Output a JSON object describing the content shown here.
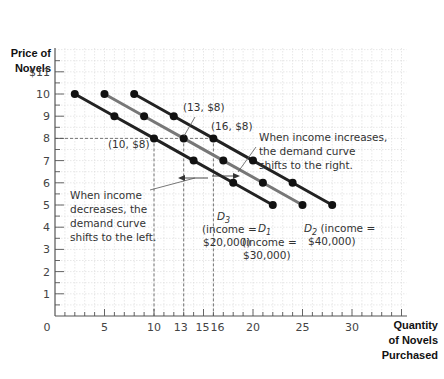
{
  "chart_data": {
    "type": "line",
    "title": "",
    "ylabel": "Price of Novels",
    "xlabel": "Quantity of Novels Purchased",
    "xlim": [
      0,
      35
    ],
    "ylim": [
      0,
      11
    ],
    "grid": true,
    "x_ticks": [
      "0",
      "5",
      "10",
      "13",
      "15",
      "16",
      "20",
      "25",
      "30"
    ],
    "x_tick_values": [
      0,
      5,
      10,
      13,
      15,
      16,
      20,
      25,
      30
    ],
    "y_ticks": [
      "1",
      "2",
      "3",
      "4",
      "5",
      "6",
      "7",
      "8",
      "9",
      "10",
      "$11"
    ],
    "y_tick_values": [
      1,
      2,
      3,
      4,
      5,
      6,
      7,
      8,
      9,
      10,
      11
    ],
    "series": [
      {
        "name": "D3",
        "label": "D3",
        "subscript": "3",
        "income_note": "(income = $20,000)",
        "color": "#222222",
        "points": [
          [
            2,
            10
          ],
          [
            6,
            9
          ],
          [
            10,
            8
          ],
          [
            14,
            7
          ],
          [
            18,
            6
          ],
          [
            22,
            5
          ]
        ]
      },
      {
        "name": "D1",
        "label": "D1",
        "subscript": "1",
        "income_note": "(income = $30,000)",
        "color": "#777777",
        "points": [
          [
            5,
            10
          ],
          [
            9,
            9
          ],
          [
            13,
            8
          ],
          [
            17,
            7
          ],
          [
            21,
            6
          ],
          [
            25,
            5
          ]
        ]
      },
      {
        "name": "D2",
        "label": "D2",
        "subscript": "2",
        "income_note": "(income = $40,000)",
        "color": "#222222",
        "points": [
          [
            8,
            10
          ],
          [
            12,
            9
          ],
          [
            16,
            8
          ],
          [
            20,
            7
          ],
          [
            24,
            6
          ],
          [
            28,
            5
          ]
        ]
      }
    ],
    "annotations": {
      "point_labels": [
        "(10, $8)",
        "(13, $8)",
        "(16, $8)"
      ],
      "increase_text": [
        "When income increases,",
        "the demand curve",
        "shifts to the right."
      ],
      "decrease_text": [
        "When income",
        "decreases, the",
        "demand curve",
        "shifts to the left."
      ]
    },
    "reference_lines": {
      "horizontal_price": 8,
      "vertical_quantities": [
        10,
        13,
        16
      ]
    }
  },
  "axis": {
    "y_title_line1": "Price of",
    "y_title_line2": "Novels",
    "x_title_line1": "Quantity",
    "x_title_line2": "of Novels",
    "x_title_line3": "Purchased",
    "origin": "0"
  },
  "labels": {
    "p10": "(10, $8)",
    "p13": "(13, $8)",
    "p16": "(16, $8)",
    "inc1": "When income increases,",
    "inc2": "the demand curve",
    "inc3": "shifts to the right.",
    "dec1": "When income",
    "dec2": "decreases, the",
    "dec3": "demand curve",
    "dec4": "shifts to the left.",
    "d3_main": "D",
    "d3_sub": "3",
    "d3_inc1": "(income =",
    "d3_inc2": "$20,000)",
    "d1_main": "D",
    "d1_sub": "1",
    "d1_inc1": "(income =",
    "d1_inc2": "$30,000)",
    "d2_main": "D",
    "d2_sub": "2",
    "d2_inc1": " (income =",
    "d2_inc2": "$40,000)"
  }
}
